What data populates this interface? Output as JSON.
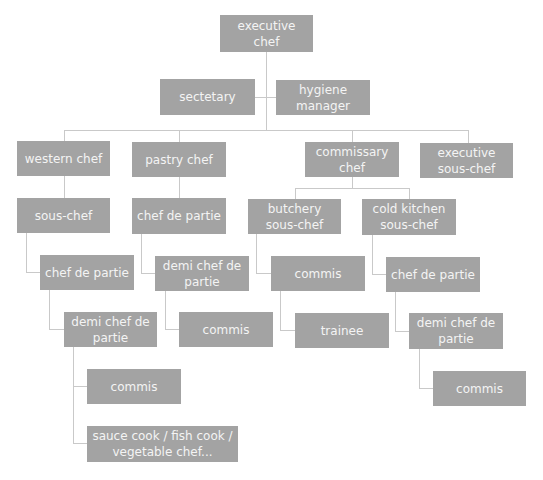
{
  "colors": {
    "box": "#a3a3a3",
    "text": "#f4f4f4",
    "line": "#c9c9c9"
  },
  "nodes": {
    "executive_chef": "executive chef",
    "secretary": "sectetary",
    "hygiene_manager": "hygiene manager",
    "western_chef": "western chef",
    "pastry_chef": "pastry chef",
    "commissary_chef": "commissary chef",
    "executive_sous_chef": "executive sous-chef",
    "western_sous_chef": "sous-chef",
    "western_chef_de_partie": "chef de partie",
    "western_demi_chef": "demi chef de partie",
    "western_commis": "commis",
    "western_stations": "sauce cook / fish cook / vegetable chef...",
    "pastry_chef_de_partie": "chef de partie",
    "pastry_demi_chef": "demi chef de partie",
    "pastry_commis": "commis",
    "butchery_sous_chef": "butchery sous-chef",
    "butchery_commis": "commis",
    "butchery_trainee": "trainee",
    "cold_kitchen_sous_chef": "cold kitchen sous-chef",
    "cold_chef_de_partie": "chef de partie",
    "cold_demi_chef": "demi chef de partie",
    "cold_commis": "commis"
  }
}
